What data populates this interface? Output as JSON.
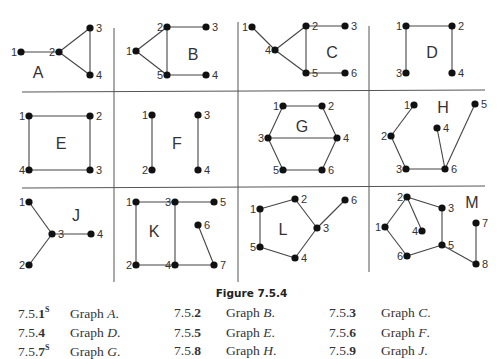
{
  "figure": {
    "caption": "Figure 7.5.4",
    "graphs": [
      {
        "name": "A",
        "nodes": [
          {
            "id": "1",
            "x": 21,
            "y": 52
          },
          {
            "id": "2",
            "x": 59,
            "y": 52
          },
          {
            "id": "3",
            "x": 90,
            "y": 28
          },
          {
            "id": "4",
            "x": 90,
            "y": 75
          }
        ],
        "edges": [
          [
            "1",
            "2"
          ],
          [
            "2",
            "3"
          ],
          [
            "2",
            "4"
          ],
          [
            "3",
            "4"
          ]
        ],
        "label_pos": [
          38,
          78
        ]
      },
      {
        "name": "B",
        "nodes": [
          {
            "id": "1",
            "x": 136,
            "y": 51
          },
          {
            "id": "2",
            "x": 167,
            "y": 27
          },
          {
            "id": "3",
            "x": 206,
            "y": 27
          },
          {
            "id": "4",
            "x": 206,
            "y": 75
          },
          {
            "id": "5",
            "x": 167,
            "y": 75
          }
        ],
        "edges": [
          [
            "1",
            "2"
          ],
          [
            "1",
            "5"
          ],
          [
            "2",
            "5"
          ],
          [
            "2",
            "3"
          ],
          [
            "5",
            "4"
          ]
        ],
        "label_pos": [
          193,
          60
        ]
      },
      {
        "name": "C",
        "nodes": [
          {
            "id": "1",
            "x": 252,
            "y": 27
          },
          {
            "id": "2",
            "x": 306,
            "y": 26
          },
          {
            "id": "3",
            "x": 345,
            "y": 26
          },
          {
            "id": "4",
            "x": 275,
            "y": 50
          },
          {
            "id": "5",
            "x": 306,
            "y": 73
          },
          {
            "id": "6",
            "x": 345,
            "y": 73
          }
        ],
        "edges": [
          [
            "1",
            "4"
          ],
          [
            "4",
            "2"
          ],
          [
            "4",
            "5"
          ],
          [
            "2",
            "5"
          ],
          [
            "2",
            "3"
          ],
          [
            "5",
            "6"
          ]
        ],
        "label_pos": [
          332,
          58
        ]
      },
      {
        "name": "D",
        "nodes": [
          {
            "id": "1",
            "x": 406,
            "y": 26
          },
          {
            "id": "2",
            "x": 452,
            "y": 26
          },
          {
            "id": "3",
            "x": 406,
            "y": 73
          },
          {
            "id": "4",
            "x": 452,
            "y": 73
          }
        ],
        "edges": [
          [
            "1",
            "2"
          ],
          [
            "1",
            "3"
          ],
          [
            "2",
            "4"
          ]
        ],
        "label_pos": [
          432,
          58
        ]
      },
      {
        "name": "E",
        "nodes": [
          {
            "id": "1",
            "x": 29,
            "y": 116
          },
          {
            "id": "2",
            "x": 90,
            "y": 116
          },
          {
            "id": "3",
            "x": 90,
            "y": 170
          },
          {
            "id": "4",
            "x": 29,
            "y": 170
          }
        ],
        "edges": [
          [
            "1",
            "2"
          ],
          [
            "2",
            "3"
          ],
          [
            "3",
            "4"
          ],
          [
            "4",
            "1"
          ]
        ],
        "label_pos": [
          61,
          149
        ]
      },
      {
        "name": "F",
        "nodes": [
          {
            "id": "1",
            "x": 152,
            "y": 115
          },
          {
            "id": "2",
            "x": 152,
            "y": 170
          },
          {
            "id": "3",
            "x": 198,
            "y": 115
          },
          {
            "id": "4",
            "x": 198,
            "y": 170
          }
        ],
        "edges": [
          [
            "1",
            "2"
          ],
          [
            "3",
            "4"
          ]
        ],
        "label_pos": [
          177,
          149
        ]
      },
      {
        "name": "G",
        "nodes": [
          {
            "id": "1",
            "x": 283,
            "y": 106
          },
          {
            "id": "2",
            "x": 322,
            "y": 106
          },
          {
            "id": "3",
            "x": 268,
            "y": 138
          },
          {
            "id": "4",
            "x": 337,
            "y": 138
          },
          {
            "id": "5",
            "x": 283,
            "y": 170
          },
          {
            "id": "6",
            "x": 322,
            "y": 170
          }
        ],
        "edges": [
          [
            "1",
            "2"
          ],
          [
            "1",
            "3"
          ],
          [
            "2",
            "4"
          ],
          [
            "3",
            "4"
          ],
          [
            "3",
            "5"
          ],
          [
            "4",
            "6"
          ],
          [
            "5",
            "6"
          ]
        ],
        "label_pos": [
          302,
          132
        ]
      },
      {
        "name": "H",
        "nodes": [
          {
            "id": "1",
            "x": 414,
            "y": 105
          },
          {
            "id": "2",
            "x": 391,
            "y": 136
          },
          {
            "id": "3",
            "x": 406,
            "y": 169
          },
          {
            "id": "4",
            "x": 437,
            "y": 128
          },
          {
            "id": "5",
            "x": 475,
            "y": 104
          },
          {
            "id": "6",
            "x": 445,
            "y": 169
          }
        ],
        "edges": [
          [
            "1",
            "2"
          ],
          [
            "2",
            "3"
          ],
          [
            "3",
            "6"
          ],
          [
            "4",
            "6"
          ],
          [
            "5",
            "6"
          ]
        ],
        "label_pos": [
          443,
          113
        ]
      },
      {
        "name": "J",
        "nodes": [
          {
            "id": "1",
            "x": 29,
            "y": 202
          },
          {
            "id": "2",
            "x": 29,
            "y": 265
          },
          {
            "id": "3",
            "x": 52,
            "y": 234
          },
          {
            "id": "4",
            "x": 91,
            "y": 234
          }
        ],
        "edges": [
          [
            "1",
            "3"
          ],
          [
            "2",
            "3"
          ],
          [
            "3",
            "4"
          ]
        ],
        "label_pos": [
          76,
          221
        ]
      },
      {
        "name": "K",
        "nodes": [
          {
            "id": "1",
            "x": 136,
            "y": 202
          },
          {
            "id": "2",
            "x": 136,
            "y": 265
          },
          {
            "id": "3",
            "x": 175,
            "y": 202
          },
          {
            "id": "4",
            "x": 175,
            "y": 265
          },
          {
            "id": "5",
            "x": 214,
            "y": 202
          },
          {
            "id": "6",
            "x": 198,
            "y": 225
          },
          {
            "id": "7",
            "x": 214,
            "y": 265
          }
        ],
        "edges": [
          [
            "1",
            "3"
          ],
          [
            "3",
            "5"
          ],
          [
            "1",
            "2"
          ],
          [
            "3",
            "4"
          ],
          [
            "2",
            "4"
          ],
          [
            "4",
            "7"
          ],
          [
            "6",
            "7"
          ]
        ],
        "label_pos": [
          154,
          237
        ]
      },
      {
        "name": "L",
        "nodes": [
          {
            "id": "1",
            "x": 260,
            "y": 209
          },
          {
            "id": "2",
            "x": 295,
            "y": 199
          },
          {
            "id": "3",
            "x": 317,
            "y": 228
          },
          {
            "id": "4",
            "x": 295,
            "y": 258
          },
          {
            "id": "5",
            "x": 260,
            "y": 247
          },
          {
            "id": "6",
            "x": 345,
            "y": 200
          }
        ],
        "edges": [
          [
            "1",
            "2"
          ],
          [
            "2",
            "3"
          ],
          [
            "3",
            "4"
          ],
          [
            "4",
            "5"
          ],
          [
            "5",
            "1"
          ],
          [
            "3",
            "6"
          ]
        ],
        "label_pos": [
          283,
          235
        ]
      },
      {
        "name": "M",
        "nodes": [
          {
            "id": "1",
            "x": 385,
            "y": 227
          },
          {
            "id": "2",
            "x": 407,
            "y": 197
          },
          {
            "id": "3",
            "x": 442,
            "y": 208
          },
          {
            "id": "4",
            "x": 422,
            "y": 231
          },
          {
            "id": "5",
            "x": 442,
            "y": 245
          },
          {
            "id": "6",
            "x": 407,
            "y": 256
          },
          {
            "id": "7",
            "x": 476,
            "y": 223
          },
          {
            "id": "8",
            "x": 476,
            "y": 264
          }
        ],
        "edges": [
          [
            "1",
            "2"
          ],
          [
            "2",
            "3"
          ],
          [
            "2",
            "4"
          ],
          [
            "3",
            "5"
          ],
          [
            "5",
            "6"
          ],
          [
            "6",
            "1"
          ],
          [
            "5",
            "8"
          ],
          [
            "7",
            "8"
          ]
        ],
        "label_pos": [
          472,
          208
        ]
      }
    ]
  },
  "exercises": [
    {
      "num": "7.5.1",
      "sup": "S",
      "text": "Graph ",
      "var": "A",
      "end": "."
    },
    {
      "num": "7.5.2",
      "sup": "",
      "text": "Graph ",
      "var": "B",
      "end": "."
    },
    {
      "num": "7.5.3",
      "sup": "",
      "text": "Graph ",
      "var": "C",
      "end": "."
    },
    {
      "num": "7.5.4",
      "sup": "",
      "text": "Graph ",
      "var": "D",
      "end": "."
    },
    {
      "num": "7.5.5",
      "sup": "",
      "text": "Graph ",
      "var": "E",
      "end": "."
    },
    {
      "num": "7.5.6",
      "sup": "",
      "text": "Graph ",
      "var": "F",
      "end": "."
    },
    {
      "num": "7.5.7",
      "sup": "S",
      "text": "Graph ",
      "var": "G",
      "end": "."
    },
    {
      "num": "7.5.8",
      "sup": "",
      "text": "Graph ",
      "var": "H",
      "end": "."
    },
    {
      "num": "7.5.9",
      "sup": "",
      "text": "Graph ",
      "var": "J",
      "end": "."
    }
  ]
}
